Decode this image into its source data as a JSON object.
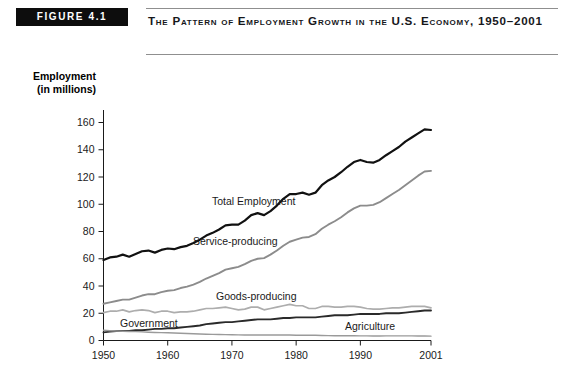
{
  "figure": {
    "badge": "FIGURE 4.1",
    "title": "The Pattern of Employment Growth in the U.S. Economy, 1950–2001"
  },
  "axis": {
    "y_title_line1": "Employment",
    "y_title_line2": "(in millions)"
  },
  "chart_data": {
    "type": "line",
    "title": "The Pattern of Employment Growth in the U.S. Economy, 1950–2001",
    "xlabel": "",
    "ylabel": "Employment (in millions)",
    "xlim": [
      1950,
      2001
    ],
    "ylim": [
      0,
      160
    ],
    "yticks": [
      0,
      20,
      40,
      60,
      80,
      100,
      120,
      140,
      160
    ],
    "xticks": [
      1950,
      1960,
      1970,
      1980,
      1990,
      2001
    ],
    "xticklabels": [
      "1950",
      "1960",
      "1970",
      "1980",
      "1990",
      "2001"
    ],
    "yticklabels": [
      "0",
      "20",
      "40",
      "60",
      "80",
      "100",
      "120",
      "140",
      "160"
    ],
    "grid": false,
    "legend": "inline-annotations",
    "x": [
      1950,
      1951,
      1952,
      1953,
      1954,
      1955,
      1956,
      1957,
      1958,
      1959,
      1960,
      1961,
      1962,
      1963,
      1964,
      1965,
      1966,
      1967,
      1968,
      1969,
      1970,
      1971,
      1972,
      1973,
      1974,
      1975,
      1976,
      1977,
      1978,
      1979,
      1980,
      1981,
      1982,
      1983,
      1984,
      1985,
      1986,
      1987,
      1988,
      1989,
      1990,
      1991,
      1992,
      1993,
      1994,
      1995,
      1996,
      1997,
      1998,
      1999,
      2000,
      2001
    ],
    "series": [
      {
        "name": "Total Employment",
        "color": "#111111",
        "values": [
          59.0,
          61.0,
          61.5,
          63.0,
          61.5,
          63.5,
          65.5,
          66.0,
          64.5,
          66.5,
          67.5,
          67.0,
          68.5,
          69.5,
          71.5,
          74.0,
          77.0,
          79.0,
          81.5,
          84.5,
          85.0,
          85.0,
          88.0,
          92.0,
          93.5,
          92.0,
          95.0,
          99.0,
          104.0,
          107.5,
          107.5,
          108.5,
          107.0,
          108.5,
          114.0,
          117.5,
          120.0,
          123.5,
          127.5,
          131.0,
          132.5,
          131.0,
          130.5,
          132.5,
          136.0,
          139.0,
          142.0,
          146.0,
          149.0,
          152.0,
          155.0,
          154.5
        ],
        "scaled_note": "plotted line rises from ~59 at 1950 to ~135 at 2001 in chart pixels"
      },
      {
        "name": "Service-producing",
        "color": "#8c8c8c",
        "values": [
          27.0,
          28.0,
          29.0,
          30.0,
          30.0,
          31.5,
          33.0,
          34.0,
          34.0,
          35.5,
          36.5,
          37.0,
          38.5,
          39.5,
          41.0,
          43.0,
          45.5,
          47.5,
          49.5,
          52.0,
          53.0,
          54.0,
          56.0,
          58.5,
          60.0,
          60.5,
          63.0,
          66.0,
          69.5,
          72.5,
          74.0,
          75.5,
          76.0,
          78.0,
          82.0,
          85.0,
          87.5,
          90.5,
          94.0,
          97.0,
          99.0,
          99.0,
          99.5,
          101.5,
          104.5,
          107.5,
          110.5,
          114.0,
          117.5,
          121.0,
          124.0,
          124.5
        ],
        "scaled_note": "rises from ~27 at 1950 to ~107 at 2001"
      },
      {
        "name": "Goods-producing",
        "color": "#adadad",
        "values": [
          20.5,
          21.5,
          21.5,
          22.5,
          21.0,
          22.0,
          22.5,
          22.0,
          20.5,
          21.5,
          21.5,
          20.5,
          21.0,
          21.0,
          21.5,
          22.5,
          23.5,
          23.5,
          24.0,
          24.5,
          23.5,
          22.5,
          23.0,
          24.5,
          24.5,
          22.5,
          23.5,
          24.5,
          25.5,
          26.5,
          25.5,
          25.5,
          23.5,
          23.5,
          25.0,
          25.0,
          24.5,
          24.5,
          25.0,
          25.0,
          24.5,
          23.5,
          23.0,
          23.0,
          23.5,
          24.0,
          24.0,
          24.5,
          25.0,
          25.0,
          25.0,
          24.0
        ],
        "scaled_note": "flat around 20–26, ends ~25 at 2001"
      },
      {
        "name": "Government",
        "color": "#2a2a2a",
        "values": [
          6.0,
          6.5,
          7.0,
          7.0,
          7.0,
          7.5,
          7.5,
          8.0,
          8.5,
          8.5,
          9.0,
          9.0,
          9.5,
          10.0,
          10.5,
          11.0,
          12.0,
          12.5,
          13.0,
          13.5,
          13.5,
          14.0,
          14.5,
          15.0,
          15.5,
          15.5,
          15.5,
          16.0,
          16.5,
          16.5,
          17.0,
          17.0,
          17.0,
          17.0,
          17.5,
          18.0,
          18.5,
          18.5,
          18.5,
          19.0,
          19.5,
          19.5,
          19.5,
          19.5,
          20.0,
          20.0,
          20.0,
          20.5,
          21.0,
          21.5,
          22.0,
          22.0
        ],
        "scaled_note": "rises steadily from ~6 at 1950 to ~22 at 2001"
      },
      {
        "name": "Agriculture",
        "color": "#9a9a9a",
        "values": [
          7.5,
          7.2,
          7.0,
          6.8,
          6.6,
          6.5,
          6.3,
          6.1,
          5.9,
          5.8,
          5.7,
          5.5,
          5.3,
          5.1,
          4.9,
          4.8,
          4.6,
          4.5,
          4.4,
          4.3,
          4.2,
          4.1,
          4.0,
          4.0,
          4.0,
          4.0,
          4.0,
          4.0,
          4.0,
          4.0,
          3.9,
          3.9,
          3.8,
          3.8,
          3.7,
          3.6,
          3.5,
          3.5,
          3.5,
          3.5,
          3.4,
          3.4,
          3.3,
          3.3,
          3.4,
          3.4,
          3.4,
          3.4,
          3.4,
          3.3,
          3.3,
          3.2
        ],
        "scaled_note": "declines from ~7.5 at 1950 to ~3 at 2001"
      }
    ],
    "annotations": [
      {
        "label": "Total Employment",
        "series": "Total Employment"
      },
      {
        "label": "Service-producing",
        "series": "Service-producing"
      },
      {
        "label": "Goods-producing",
        "series": "Goods-producing"
      },
      {
        "label": "Government",
        "series": "Government"
      },
      {
        "label": "Agriculture",
        "series": "Agriculture"
      }
    ]
  }
}
